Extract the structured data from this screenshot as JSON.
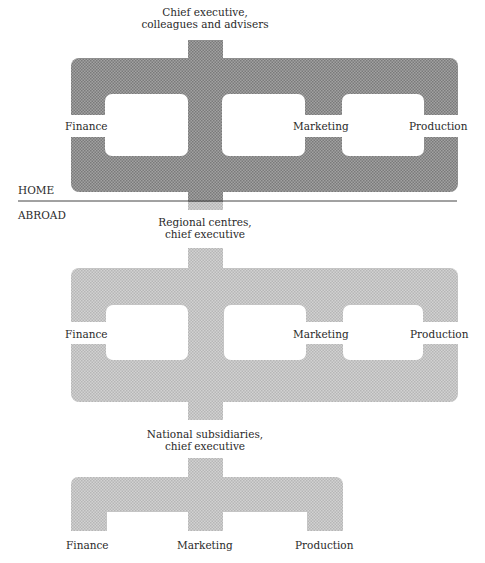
{
  "diagram": {
    "type": "organization-structure",
    "colors": {
      "home_fill": "#8e8e8e",
      "abroad_fill": "#c6c6c6",
      "divider": "#444444",
      "text": "#2a2a2a"
    },
    "zones": {
      "home_label": "HOME",
      "abroad_label": "ABROAD"
    },
    "levels": [
      {
        "id": "head-office",
        "zone": "HOME",
        "title_line1": "Chief executive,",
        "title_line2": "colleagues and advisers",
        "functions": [
          "Finance",
          "Marketing",
          "Production"
        ]
      },
      {
        "id": "regional-centres",
        "zone": "ABROAD",
        "title_line1": "Regional centres,",
        "title_line2": "chief executive",
        "functions": [
          "Finance",
          "Marketing",
          "Production"
        ]
      },
      {
        "id": "national-subsidiaries",
        "zone": "ABROAD",
        "title_line1": "National subsidiaries,",
        "title_line2": "chief executive",
        "functions": [
          "Finance",
          "Marketing",
          "Production"
        ]
      }
    ]
  }
}
